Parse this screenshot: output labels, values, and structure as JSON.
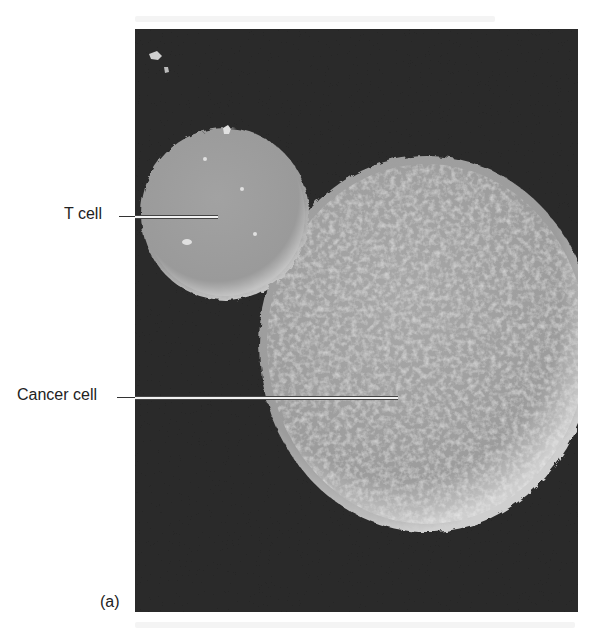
{
  "figure": {
    "panel_label": "(a)",
    "image_description": "Scanning electron micrograph of a T cell attached to a cancer cell",
    "labels": [
      {
        "text": "T cell",
        "target": "small-cell"
      },
      {
        "text": "Cancer cell",
        "target": "large-cell"
      }
    ],
    "colors": {
      "background": "#2a2a2a",
      "cell_fill": "#9a9a9a",
      "cell_edge": "#c8c8c8",
      "label_text": "#222222"
    }
  }
}
